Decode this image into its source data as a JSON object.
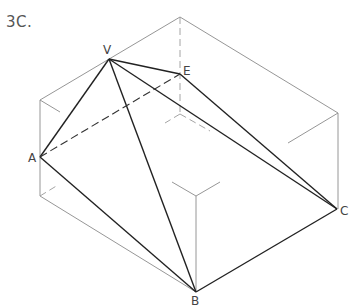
{
  "figure": {
    "title": "3C.",
    "labels": {
      "V": "V",
      "E": "E",
      "A": "A",
      "B": "B",
      "C": "C"
    }
  }
}
